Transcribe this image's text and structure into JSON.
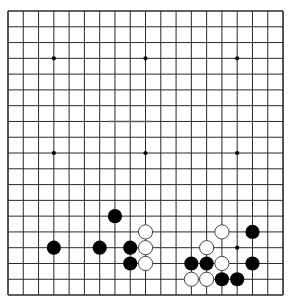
{
  "board": {
    "size": 19,
    "origin_x": 8,
    "origin_y": 11,
    "step_x": 15.28,
    "step_y": 15.78,
    "background": "#ffffff",
    "line_color": "#2a2a2a",
    "star_points": [
      [
        3,
        3
      ],
      [
        9,
        3
      ],
      [
        15,
        3
      ],
      [
        3,
        9
      ],
      [
        9,
        9
      ],
      [
        15,
        9
      ],
      [
        3,
        15
      ],
      [
        9,
        15
      ],
      [
        15,
        15
      ]
    ],
    "stones": [
      {
        "color": "black",
        "col": 7,
        "row": 13
      },
      {
        "color": "white",
        "col": 9,
        "row": 14
      },
      {
        "color": "black",
        "col": 3,
        "row": 15
      },
      {
        "color": "black",
        "col": 6,
        "row": 15
      },
      {
        "color": "black",
        "col": 8,
        "row": 15
      },
      {
        "color": "white",
        "col": 9,
        "row": 15
      },
      {
        "color": "black",
        "col": 8,
        "row": 16
      },
      {
        "color": "white",
        "col": 9,
        "row": 16
      },
      {
        "color": "white",
        "col": 14,
        "row": 14
      },
      {
        "color": "black",
        "col": 16,
        "row": 14
      },
      {
        "color": "white",
        "col": 13,
        "row": 15
      },
      {
        "color": "black",
        "col": 12,
        "row": 16
      },
      {
        "color": "black",
        "col": 13,
        "row": 16
      },
      {
        "color": "white",
        "col": 14,
        "row": 16
      },
      {
        "color": "black",
        "col": 16,
        "row": 16
      },
      {
        "color": "white",
        "col": 12,
        "row": 17
      },
      {
        "color": "white",
        "col": 13,
        "row": 17
      },
      {
        "color": "black",
        "col": 14,
        "row": 17
      },
      {
        "color": "black",
        "col": 15,
        "row": 17
      }
    ],
    "stone_colors": {
      "black": "#000000",
      "white": "#ffffff",
      "white_outline": "#333333"
    }
  }
}
